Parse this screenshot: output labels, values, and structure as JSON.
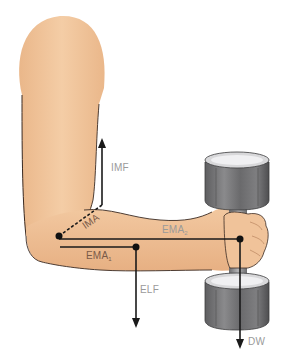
{
  "figure": {
    "colors": {
      "skin": "#f1c49a",
      "skin_shadow": "#e2a877",
      "outline": "#3a2a22",
      "lever_line": "#1a1a1a",
      "dumbbell": "#6e6e70",
      "dumbbell_light": "#bdbdbf",
      "label_gray": "#9a9a9a",
      "label_brown": "#7a5a48"
    },
    "labels": {
      "imf": "IMF",
      "ima": "IMA",
      "ema1_main": "EMA",
      "ema1_sub": "1",
      "ema2_main": "EMA",
      "ema2_sub": "2",
      "elf": "ELF",
      "dw": "DW"
    }
  }
}
